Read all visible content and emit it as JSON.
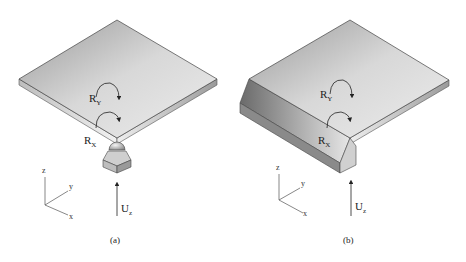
{
  "figure": {
    "panels": [
      {
        "caption": "(a)",
        "rotation_labels": [
          {
            "main": "R",
            "sub": "Y"
          },
          {
            "main": "R",
            "sub": "X"
          }
        ],
        "force_label": {
          "main": "U",
          "sub": "z"
        },
        "axes": {
          "z": "z",
          "y": "y",
          "x": "x"
        },
        "support": "ball-and-socket point support"
      },
      {
        "caption": "(b)",
        "rotation_labels": [
          {
            "main": "R",
            "sub": "Y"
          },
          {
            "main": "R",
            "sub": "X"
          }
        ],
        "force_label": {
          "main": "U",
          "sub": "z"
        },
        "axes": {
          "z": "z",
          "y": "y",
          "x": "x"
        },
        "support": "edge channel support"
      }
    ]
  }
}
